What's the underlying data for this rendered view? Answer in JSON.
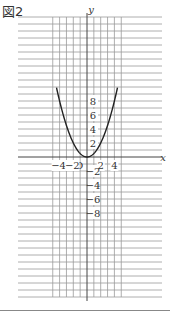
{
  "figure": {
    "label": "図2"
  },
  "chart_data": {
    "type": "line",
    "title": "",
    "function": "y = 0.5x^2 (parabola, vertex at origin)",
    "xlabel": "x",
    "ylabel": "y",
    "origin_label": "O",
    "xlim": [
      -5,
      5
    ],
    "ylim": [
      -10,
      10
    ],
    "grid": true,
    "x_ticks": [
      -4,
      -2,
      2,
      4
    ],
    "y_ticks": [
      8,
      6,
      4,
      2,
      -2,
      -4,
      -6,
      -8
    ],
    "x_tick_labels": [
      "−4",
      "−2",
      "2",
      "4"
    ],
    "y_tick_labels": [
      "8",
      "6",
      "4",
      "2",
      "−2",
      "−4",
      "−6",
      "−8"
    ],
    "series": [
      {
        "name": "parabola",
        "x": [
          -4.4,
          -4,
          -3,
          -2,
          -1,
          0,
          1,
          2,
          3,
          4,
          4.4
        ],
        "y": [
          9.68,
          8,
          4.5,
          2,
          0.5,
          0,
          0.5,
          2,
          4.5,
          8,
          9.68
        ]
      }
    ],
    "legend": null
  }
}
